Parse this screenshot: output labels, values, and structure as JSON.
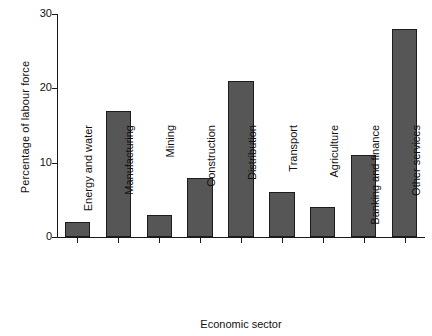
{
  "chart_data": {
    "type": "bar",
    "title": "",
    "xlabel": "Economic sector",
    "ylabel": "Percentage of labour force",
    "categories": [
      "Energy and water",
      "Manufacturing",
      "Mining",
      "Construction",
      "Distribution",
      "Transport",
      "Agriculture",
      "Banking and finance",
      "Other services"
    ],
    "values": [
      2,
      17,
      3,
      8,
      21,
      6,
      4,
      11,
      28
    ],
    "ylim": [
      0,
      30
    ],
    "yticks": [
      0,
      10,
      20,
      30
    ],
    "ytick_labels": [
      "0",
      "10",
      "20",
      "30"
    ],
    "grid": false,
    "legend": false,
    "bar_color": "#565656",
    "bar_edge_color": "#1c1c1c",
    "axis_color": "#1a1a1a",
    "background_color": "#ffffff"
  }
}
